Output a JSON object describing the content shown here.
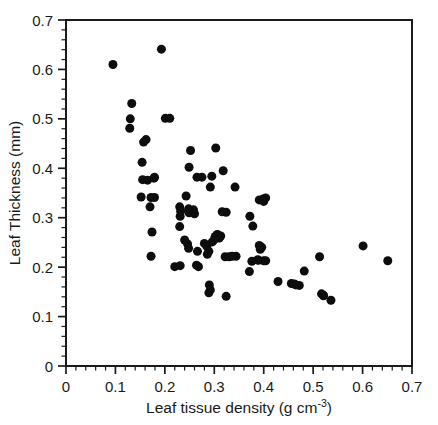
{
  "chart_data": {
    "type": "scatter",
    "title": "",
    "xlabel": "Leaf tissue density (g cm-3)",
    "xlabel_base": "Leaf tissue density (g cm",
    "xlabel_sup": "-3",
    "xlabel_close": ")",
    "ylabel": "Leaf Thickness (mm)",
    "xlim": [
      0,
      0.7
    ],
    "ylim": [
      0,
      0.7
    ],
    "xticks": [
      0,
      0.1,
      0.2,
      0.3,
      0.4,
      0.5,
      0.6,
      0.7
    ],
    "yticks": [
      0,
      0.1,
      0.2,
      0.3,
      0.4,
      0.5,
      0.6,
      0.7
    ],
    "xtick_labels": [
      "0",
      "0.1",
      "0.2",
      "0.3",
      "0.4",
      "0.5",
      "0.6",
      "0.7"
    ],
    "ytick_labels": [
      "0",
      "0.1",
      "0.2",
      "0.3",
      "0.4",
      "0.5",
      "0.6",
      "0.7"
    ],
    "minor_ticks_per_interval": 5,
    "grid": false,
    "legend": null,
    "marker": {
      "shape": "circle",
      "color": "#0d0d0d",
      "size_px": 9
    },
    "frame_color": "#1a1a1a",
    "background": "#ffffff",
    "n_points": 95,
    "points": [
      [
        0.095,
        0.61
      ],
      [
        0.193,
        0.641
      ],
      [
        0.133,
        0.531
      ],
      [
        0.13,
        0.5
      ],
      [
        0.129,
        0.481
      ],
      [
        0.201,
        0.501
      ],
      [
        0.21,
        0.501
      ],
      [
        0.157,
        0.453
      ],
      [
        0.162,
        0.458
      ],
      [
        0.154,
        0.412
      ],
      [
        0.252,
        0.436
      ],
      [
        0.303,
        0.441
      ],
      [
        0.155,
        0.377
      ],
      [
        0.165,
        0.376
      ],
      [
        0.178,
        0.38
      ],
      [
        0.179,
        0.382
      ],
      [
        0.249,
        0.402
      ],
      [
        0.318,
        0.395
      ],
      [
        0.275,
        0.382
      ],
      [
        0.295,
        0.384
      ],
      [
        0.152,
        0.342
      ],
      [
        0.172,
        0.341
      ],
      [
        0.265,
        0.382
      ],
      [
        0.292,
        0.362
      ],
      [
        0.342,
        0.362
      ],
      [
        0.17,
        0.322
      ],
      [
        0.23,
        0.322
      ],
      [
        0.232,
        0.313
      ],
      [
        0.231,
        0.303
      ],
      [
        0.243,
        0.344
      ],
      [
        0.248,
        0.318
      ],
      [
        0.249,
        0.31
      ],
      [
        0.255,
        0.312
      ],
      [
        0.316,
        0.312
      ],
      [
        0.324,
        0.311
      ],
      [
        0.372,
        0.303
      ],
      [
        0.391,
        0.336
      ],
      [
        0.399,
        0.338
      ],
      [
        0.404,
        0.34
      ],
      [
        0.4,
        0.333
      ],
      [
        0.378,
        0.283
      ],
      [
        0.174,
        0.271
      ],
      [
        0.23,
        0.282
      ],
      [
        0.246,
        0.247
      ],
      [
        0.248,
        0.238
      ],
      [
        0.24,
        0.255
      ],
      [
        0.266,
        0.232
      ],
      [
        0.28,
        0.248
      ],
      [
        0.285,
        0.242
      ],
      [
        0.289,
        0.232
      ],
      [
        0.296,
        0.251
      ],
      [
        0.302,
        0.262
      ],
      [
        0.306,
        0.266
      ],
      [
        0.31,
        0.259
      ],
      [
        0.313,
        0.263
      ],
      [
        0.172,
        0.222
      ],
      [
        0.22,
        0.201
      ],
      [
        0.264,
        0.204
      ],
      [
        0.268,
        0.201
      ],
      [
        0.286,
        0.226
      ],
      [
        0.322,
        0.221
      ],
      [
        0.33,
        0.221
      ],
      [
        0.344,
        0.222
      ],
      [
        0.391,
        0.244
      ],
      [
        0.393,
        0.236
      ],
      [
        0.396,
        0.24
      ],
      [
        0.376,
        0.212
      ],
      [
        0.389,
        0.214
      ],
      [
        0.4,
        0.213
      ],
      [
        0.371,
        0.191
      ],
      [
        0.29,
        0.164
      ],
      [
        0.292,
        0.154
      ],
      [
        0.289,
        0.148
      ],
      [
        0.324,
        0.141
      ],
      [
        0.429,
        0.171
      ],
      [
        0.456,
        0.167
      ],
      [
        0.462,
        0.166
      ],
      [
        0.472,
        0.163
      ],
      [
        0.482,
        0.192
      ],
      [
        0.513,
        0.221
      ],
      [
        0.517,
        0.146
      ],
      [
        0.521,
        0.143
      ],
      [
        0.536,
        0.133
      ],
      [
        0.601,
        0.243
      ],
      [
        0.651,
        0.213
      ],
      [
        0.231,
        0.203
      ],
      [
        0.258,
        0.316
      ],
      [
        0.26,
        0.308
      ],
      [
        0.179,
        0.341
      ],
      [
        0.307,
        0.265
      ],
      [
        0.3,
        0.256
      ],
      [
        0.336,
        0.222
      ],
      [
        0.388,
        0.215
      ],
      [
        0.404,
        0.213
      ],
      [
        0.465,
        0.164
      ],
      [
        0.521,
        0.142
      ]
    ]
  }
}
